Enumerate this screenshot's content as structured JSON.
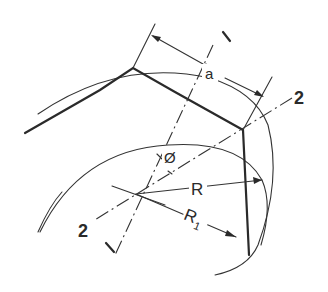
{
  "diagram": {
    "type": "geometric construction",
    "labels": {
      "axis1_top": "I",
      "axis1_bottom": "I",
      "axis2_right": "2",
      "axis2_left": "2",
      "distance": "a",
      "angle": "Ø",
      "radius": "R",
      "radius1": "R",
      "radius1_sub": "1"
    },
    "colors": {
      "ink": "#2a2a2a",
      "background": "#ffffff"
    }
  }
}
